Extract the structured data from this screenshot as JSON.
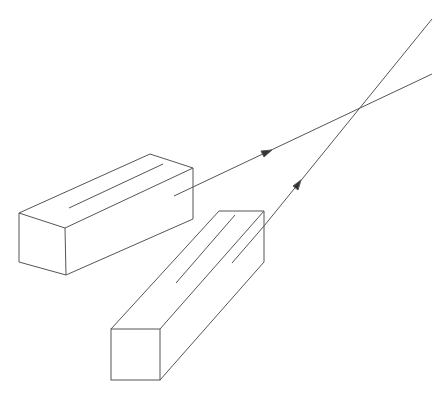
{
  "diagram": {
    "stroke_color": "#555555",
    "background": "#ffffff",
    "elements": [
      {
        "name": "box-1",
        "type": "rectangular-prism"
      },
      {
        "name": "box-2",
        "type": "rectangular-prism"
      },
      {
        "name": "beam-1",
        "type": "arrow-line",
        "direction": "up-right"
      },
      {
        "name": "beam-2",
        "type": "arrow-line",
        "direction": "up-right"
      }
    ]
  }
}
